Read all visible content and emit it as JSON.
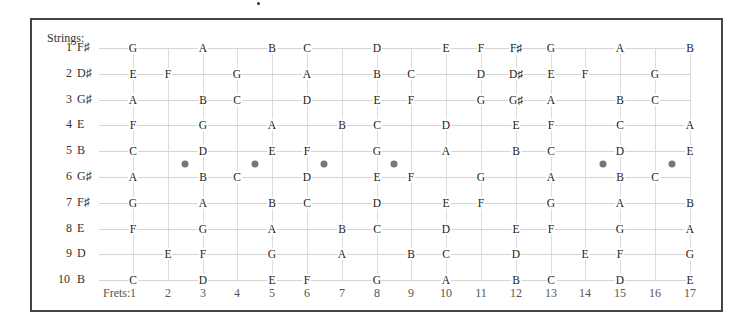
{
  "diagram": {
    "strings_title": "Strings:",
    "frets_title": "Frets:",
    "fret_numbers": [
      "1",
      "2",
      "3",
      "4",
      "5",
      "6",
      "7",
      "8",
      "9",
      "10",
      "11",
      "12",
      "13",
      "14",
      "15",
      "16",
      "17"
    ],
    "inlay_dot_positions": [
      2.5,
      4.5,
      6.5,
      8.5,
      14.5,
      16.5
    ],
    "strings": [
      {
        "number": "1",
        "open": "F♯",
        "notes": {
          "1": "G",
          "3": "A",
          "5": "B",
          "6": "C",
          "8": "D",
          "10": "E",
          "11": "F",
          "12": "F♯",
          "13": "G",
          "15": "A",
          "17": "B"
        }
      },
      {
        "number": "2",
        "open": "D♯",
        "notes": {
          "1": "E",
          "2": "F",
          "4": "G",
          "6": "A",
          "8": "B",
          "9": "C",
          "11": "D",
          "12": "D♯",
          "13": "E",
          "14": "F",
          "16": "G"
        }
      },
      {
        "number": "3",
        "open": "G♯",
        "notes": {
          "1": "A",
          "3": "B",
          "4": "C",
          "6": "D",
          "8": "E",
          "9": "F",
          "11": "G",
          "12": "G♯",
          "13": "A",
          "15": "B",
          "16": "C"
        }
      },
      {
        "number": "4",
        "open": "E",
        "notes": {
          "1": "F",
          "3": "G",
          "5": "A",
          "7": "B",
          "8": "C",
          "10": "D",
          "12": "E",
          "13": "F",
          "15": "C",
          "17": "A"
        }
      },
      {
        "number": "5",
        "open": "B",
        "notes": {
          "1": "C",
          "3": "D",
          "5": "E",
          "6": "F",
          "8": "G",
          "10": "A",
          "12": "B",
          "13": "C",
          "15": "D",
          "17": "E"
        }
      },
      {
        "number": "6",
        "open": "G♯",
        "notes": {
          "1": "A",
          "3": "B",
          "4": "C",
          "6": "D",
          "8": "E",
          "9": "F",
          "11": "G",
          "13": "A",
          "15": "B",
          "16": "C"
        }
      },
      {
        "number": "7",
        "open": "F♯",
        "notes": {
          "1": "G",
          "3": "A",
          "5": "B",
          "6": "C",
          "8": "D",
          "10": "E",
          "11": "F",
          "13": "G",
          "15": "A",
          "17": "B"
        }
      },
      {
        "number": "8",
        "open": "E",
        "notes": {
          "1": "F",
          "3": "G",
          "5": "A",
          "7": "B",
          "8": "C",
          "10": "D",
          "12": "E",
          "13": "F",
          "15": "G",
          "17": "A"
        }
      },
      {
        "number": "9",
        "open": "D",
        "notes": {
          "2": "E",
          "3": "F",
          "5": "G",
          "7": "A",
          "9": "B",
          "10": "C",
          "12": "D",
          "14": "E",
          "15": "F",
          "17": "G"
        }
      },
      {
        "number": "10",
        "open": "B",
        "notes": {
          "1": "C",
          "3": "D",
          "5": "E",
          "6": "F",
          "8": "G",
          "10": "A",
          "12": "B",
          "13": "C",
          "15": "D",
          "17": "E"
        }
      }
    ]
  }
}
